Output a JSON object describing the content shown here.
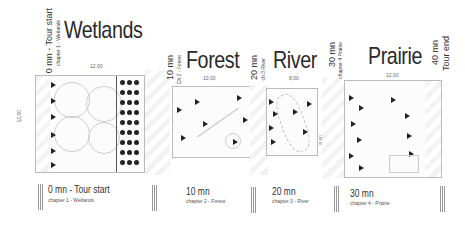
{
  "chapters": [
    {
      "name": "Wetlands",
      "width_dim": "12,00",
      "height_dim": "12,00",
      "start_time": "0 mn - Tour start",
      "start_sub": "chapter 1 - Wetlands",
      "caption_time": "0 mn - Tour start",
      "caption_sub": "chapter 1 - Wetlands"
    },
    {
      "name": "Forest",
      "width_dim": "10,00",
      "start_time": "10 mn",
      "start_sub": "Ch 2 - Forest",
      "caption_time": "10 mn",
      "caption_sub": "chapter 2 - Forest"
    },
    {
      "name": "River",
      "width_dim": "8,00",
      "height_dim": "8,00",
      "start_time": "20 mn",
      "start_sub": "ch 3 River",
      "caption_time": "20 mn",
      "caption_sub": "chapter 3 - River"
    },
    {
      "name": "Prairie",
      "width_dim": "12,00",
      "start_time": "30 mn",
      "start_sub": "chapter 4 Prairie",
      "caption_time": "30 mn",
      "caption_sub": "chapter 4 - Prairie"
    }
  ],
  "tour_end": {
    "time": "40 mn",
    "label": "Tour end"
  }
}
